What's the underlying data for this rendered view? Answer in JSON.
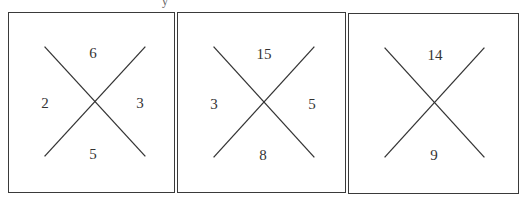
{
  "puzzle": {
    "description": "Three boxes each with an X; numbers placed in the four regions (top, left, right, bottom). Third box has missing left and right values.",
    "boxes": [
      {
        "top": "6",
        "left": "2",
        "right": "3",
        "bottom": "5"
      },
      {
        "top": "15",
        "left": "3",
        "right": "5",
        "bottom": "8"
      },
      {
        "top": "14",
        "left": "",
        "right": "",
        "bottom": "9"
      }
    ]
  },
  "stray_text": "y"
}
